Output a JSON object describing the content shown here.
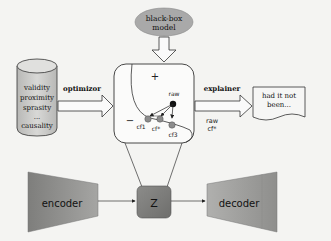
{
  "diagram": {
    "black_box": {
      "line1": "black-box",
      "line2": "model"
    },
    "database": {
      "items": [
        "validity",
        "proximity",
        "sprasity",
        "...",
        "causality"
      ]
    },
    "arrows": {
      "optimizer_label": "optimizor",
      "explainer_label": "explainer",
      "explainer_sub1": "raw",
      "explainer_sub2": "cf*"
    },
    "decision_space": {
      "plus": "+",
      "minus": "−",
      "raw": "raw",
      "cf1": "cf1",
      "cfstar": "cf*",
      "cf3": "cf3"
    },
    "output_document": {
      "line1": "had it not",
      "line2": "been..."
    },
    "autoencoder": {
      "encoder": "encoder",
      "latent": "Z",
      "decoder": "decoder"
    },
    "colors": {
      "background": "#f4f4f2",
      "ellipse": "#a9a9a9",
      "cylinder": "#c8c8c6",
      "encoder": "#8a8a88",
      "latent": "#7a7a78",
      "decoder": "#9a9a98",
      "point_gray": "#8c8c8c",
      "point_raw": "#111111"
    }
  }
}
